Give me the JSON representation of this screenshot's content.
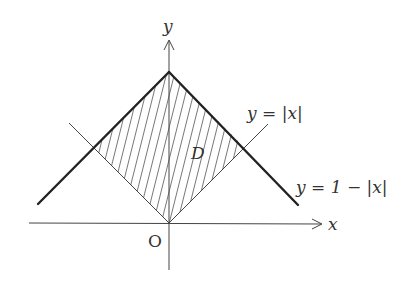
{
  "diagram": {
    "labels": {
      "y_axis": "y",
      "x_axis": "x",
      "origin": "O",
      "region": "D",
      "curve_abs": "y = |x|",
      "curve_one_minus_abs": "y = 1 − |x|"
    },
    "geometry": {
      "origin_px": [
        169,
        223
      ],
      "unit_px": 151,
      "apex": [
        0,
        1
      ],
      "left_intersection": [
        -0.5,
        0.5
      ],
      "right_intersection": [
        0.5,
        0.5
      ]
    },
    "colors": {
      "line": "#222222",
      "thin_line": "#444444",
      "hatch": "#555555",
      "text": "#333333"
    }
  }
}
